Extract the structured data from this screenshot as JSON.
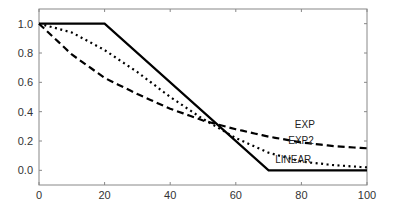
{
  "chart_data": {
    "type": "line",
    "title": "",
    "xlabel": "",
    "ylabel": "",
    "xlim": [
      0,
      100
    ],
    "ylim": [
      -0.1,
      1.1
    ],
    "grid": false,
    "legend": "inline labels",
    "x_ticks": [
      "0",
      "20",
      "40",
      "60",
      "80",
      "100"
    ],
    "y_ticks": [
      "0.0",
      "0.2",
      "0.4",
      "0.6",
      "0.8",
      "1.0"
    ],
    "series": [
      {
        "name": "LINEAR",
        "style": "solid",
        "x": [
          0,
          20,
          70,
          100
        ],
        "y": [
          1.0,
          1.0,
          0.0,
          0.0
        ]
      },
      {
        "name": "EXP",
        "style": "dashed",
        "x": [
          0,
          10,
          20,
          30,
          40,
          50,
          60,
          70,
          80,
          90,
          100
        ],
        "y": [
          1.0,
          0.79,
          0.63,
          0.52,
          0.42,
          0.34,
          0.28,
          0.23,
          0.19,
          0.165,
          0.15
        ]
      },
      {
        "name": "EXP2",
        "style": "dotted",
        "x": [
          0,
          10,
          20,
          30,
          40,
          50,
          60,
          70,
          80,
          90,
          100
        ],
        "y": [
          1.0,
          0.94,
          0.82,
          0.67,
          0.5,
          0.35,
          0.22,
          0.12,
          0.06,
          0.035,
          0.02
        ]
      }
    ],
    "annotations": [
      {
        "text": "EXP",
        "x": 78,
        "y": 0.29
      },
      {
        "text": "EXP2",
        "x": 76,
        "y": 0.18
      },
      {
        "text": "LINEAR",
        "x": 72,
        "y": 0.05
      }
    ]
  }
}
